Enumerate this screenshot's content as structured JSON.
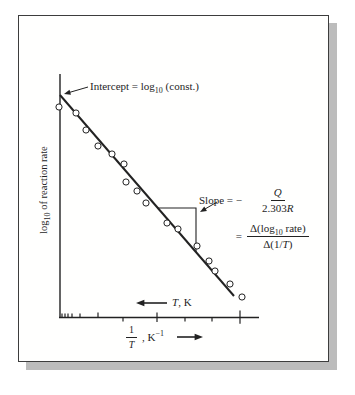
{
  "colors": {
    "ink": "#222222",
    "card_border": "#3d3d3d",
    "shadow": "#bcbcbc",
    "background": "#ffffff",
    "point_fill": "#ffffff"
  },
  "labels": {
    "y_axis": {
      "pre": "log",
      "sub": "10",
      "post": " of reaction rate"
    },
    "x_axis": {
      "num": "1",
      "den": "T",
      "unit_pre": ", K",
      "unit_sup": "−1"
    },
    "t_scale": {
      "var": "T",
      "unit": ", K"
    },
    "intercept": {
      "pre": "Intercept = log",
      "sub": "10",
      "post": " (const.)"
    },
    "slope": {
      "lhs1": "Slope = −",
      "f1_num": "Q",
      "f1_den_num": "2.303",
      "f1_den_var": "R",
      "lhs2": "=",
      "f2_num_pre": "Δ(log",
      "f2_num_sub": "10",
      "f2_num_post": " rate)",
      "f2_den_pre": "Δ(1/",
      "f2_den_var": "T",
      "f2_den_post": ")"
    }
  },
  "chart_data": {
    "type": "scatter",
    "title": "",
    "xlabel": "1/T, K^-1",
    "xlabel_secondary": "T, K (increasing toward the left)",
    "ylabel": "log10 of reaction rate",
    "axes_numeric_labels": false,
    "legend": "none",
    "grid": false,
    "annotations": [
      "Intercept = log10 (const.)",
      "Slope = − Q/2.303R = Δ(log10 rate)/Δ(1/T)"
    ],
    "geometry_px": {
      "y_axis": {
        "x": 60,
        "y1": 74,
        "y2": 318
      },
      "x_axis": {
        "y": 317.5,
        "x1": 59,
        "x2": 259
      },
      "x_ticks": [
        {
          "x": 62,
          "dir": "up",
          "len": 4
        },
        {
          "x": 65,
          "dir": "up",
          "len": 4
        },
        {
          "x": 68,
          "dir": "up",
          "len": 4
        },
        {
          "x": 72,
          "dir": "up",
          "len": 4
        },
        {
          "x": 80,
          "dir": "up",
          "len": 4
        },
        {
          "x": 98,
          "dir": "up",
          "len": 5
        },
        {
          "x": 123,
          "dir": "down",
          "len": 4
        },
        {
          "x": 157,
          "dir": "cross",
          "len": 5
        },
        {
          "x": 185,
          "dir": "down",
          "len": 4
        },
        {
          "x": 212,
          "dir": "down",
          "len": 4
        },
        {
          "x": 240,
          "dir": "cross",
          "len": 7
        }
      ],
      "fit_line": {
        "x1": 60,
        "y1": 95,
        "x2": 234,
        "y2": 296
      },
      "slope_triangle": {
        "left_x": 158,
        "top_y": 208,
        "corner_x": 196,
        "bottom_y": 252
      },
      "point_radius": 3.1,
      "points": [
        [
          59,
          107
        ],
        [
          76,
          113
        ],
        [
          86,
          130
        ],
        [
          98,
          146
        ],
        [
          112,
          154
        ],
        [
          124,
          164
        ],
        [
          126,
          182
        ],
        [
          137,
          191
        ],
        [
          146,
          203
        ],
        [
          167,
          223
        ],
        [
          178,
          229
        ],
        [
          197,
          246
        ],
        [
          209,
          261
        ],
        [
          215,
          271
        ],
        [
          230,
          284
        ],
        [
          242,
          297
        ]
      ],
      "arrows": [
        {
          "name": "intercept-arrow",
          "from": [
            88,
            87
          ],
          "to": [
            64,
            94
          ],
          "head": 7,
          "w": 1
        },
        {
          "name": "slope-arrow",
          "from": [
            217,
            202
          ],
          "to": [
            200,
            212
          ],
          "head": 7,
          "w": 1
        },
        {
          "name": "t-scale-arrow",
          "from": [
            167,
            303
          ],
          "to": [
            136,
            303
          ],
          "head": 9,
          "w": 1.6
        },
        {
          "name": "x-label-arrow",
          "from": [
            177,
            337
          ],
          "to": [
            203,
            337
          ],
          "head": 9,
          "w": 1.6
        }
      ]
    }
  }
}
